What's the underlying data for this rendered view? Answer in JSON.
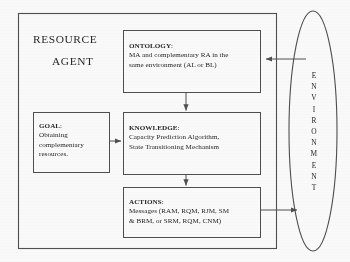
{
  "diagram": {
    "title_lines": [
      "RESOURCE",
      "AGENT"
    ],
    "agent_frame_name": "resource-agent-frame",
    "boxes": {
      "ontology": {
        "header": "ONTOLOGY",
        "header_suffix": ":",
        "lines": [
          "MA and complementary RA in the",
          "same environment (AL or BL)"
        ]
      },
      "knowledge": {
        "header": "KNOWLEDGE",
        "header_suffix": ":",
        "lines": [
          "Capacity Prediction Algorithm,",
          "State Transitioning Mechanism"
        ]
      },
      "actions": {
        "header": "ACTIONS",
        "header_suffix": ":",
        "lines": [
          "Messages (RAM, RQM, RJM, SM",
          "& BRM, or SRM, RQM, CNM)"
        ]
      },
      "goal": {
        "header": "GOAL",
        "header_suffix": ":",
        "lines": [
          "Obtaining",
          "complementary",
          "resources."
        ]
      }
    },
    "environment": {
      "letters": [
        "E",
        "N",
        "V",
        "I",
        "R",
        "O",
        "N",
        "M",
        "E",
        "N",
        "T"
      ]
    },
    "colors": {
      "stroke": "#4a4a4a",
      "text": "#202020",
      "background": "#ffffff"
    }
  }
}
